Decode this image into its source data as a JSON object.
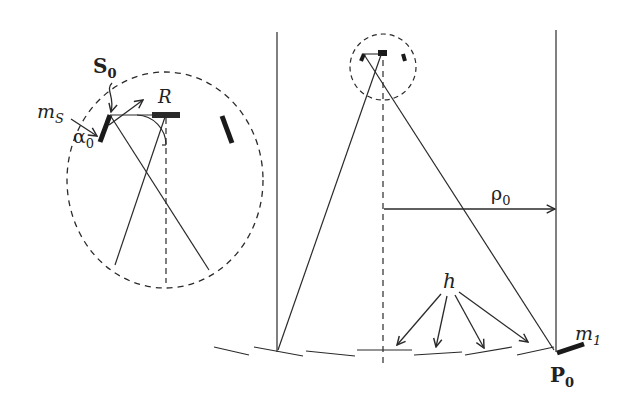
{
  "diagram": {
    "colors": {
      "stroke": "#2a2a2a",
      "background": "#ffffff"
    },
    "inset": {
      "labels": {
        "s0_main": "S",
        "s0_sub": "0",
        "r": "R",
        "ms_main": "m",
        "ms_sub": "S",
        "alpha_main": "α",
        "alpha_sub": "0"
      }
    },
    "main": {
      "labels": {
        "rho_main": "ρ",
        "rho_sub": "0",
        "h": "h",
        "m1_main": "m",
        "m1_sub": "1",
        "p0_main": "P",
        "p0_sub": "0"
      }
    }
  }
}
